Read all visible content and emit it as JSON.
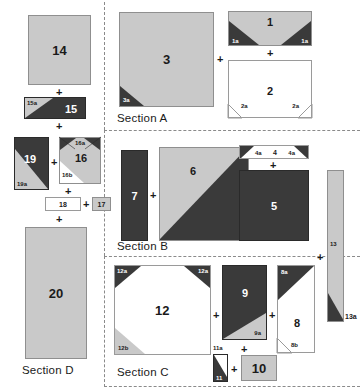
{
  "colors": {
    "gray_fabric": "#c9c9c9",
    "dark_fabric": "#3a3a3a",
    "white_fabric": "#ffffff",
    "outline": "#8f8f8f",
    "divider": "#8a8a8a",
    "text_dark": "#1a1a1a",
    "text_light": "#ffffff"
  },
  "symbols": {
    "plus": "+"
  },
  "sections": [
    {
      "id": "A",
      "label": "Section A"
    },
    {
      "id": "B",
      "label": "Section B"
    },
    {
      "id": "C",
      "label": "Section C"
    },
    {
      "id": "D",
      "label": "Section D"
    }
  ],
  "pieces": {
    "p1": {
      "label": "1",
      "fabric": "gray"
    },
    "p1a_l": {
      "label": "1a",
      "fabric": "dark"
    },
    "p1a_r": {
      "label": "1a",
      "fabric": "dark"
    },
    "p2": {
      "label": "2",
      "fabric": "white"
    },
    "p2a_l": {
      "label": "2a",
      "fabric": "white"
    },
    "p2a_r": {
      "label": "2a",
      "fabric": "white"
    },
    "p3": {
      "label": "3",
      "fabric": "gray"
    },
    "p3a": {
      "label": "3a",
      "fabric": "dark"
    },
    "p4": {
      "label": "4",
      "fabric": "white"
    },
    "p4a_l": {
      "label": "4a",
      "fabric": "dark"
    },
    "p4a_r": {
      "label": "4a",
      "fabric": "dark"
    },
    "p5": {
      "label": "5",
      "fabric": "dark"
    },
    "p6": {
      "label": "6",
      "fabric": "gray-dark-hst"
    },
    "p7": {
      "label": "7",
      "fabric": "dark"
    },
    "p8": {
      "label": "8",
      "fabric": "white"
    },
    "p8a": {
      "label": "8a",
      "fabric": "dark"
    },
    "p8b": {
      "label": "8b",
      "fabric": "white"
    },
    "p9": {
      "label": "9",
      "fabric": "dark"
    },
    "p9a": {
      "label": "9a",
      "fabric": "gray"
    },
    "p10": {
      "label": "10",
      "fabric": "gray"
    },
    "p11": {
      "label": "11",
      "fabric": "dark"
    },
    "p11a": {
      "label": "11a",
      "fabric": "white"
    },
    "p12": {
      "label": "12",
      "fabric": "white"
    },
    "p12a_l": {
      "label": "12a",
      "fabric": "dark"
    },
    "p12a_r": {
      "label": "12a",
      "fabric": "dark"
    },
    "p12b": {
      "label": "12b",
      "fabric": "gray"
    },
    "p13": {
      "label": "13",
      "fabric": "gray"
    },
    "p13a": {
      "label": "13a",
      "fabric": "dark"
    },
    "p14": {
      "label": "14",
      "fabric": "gray"
    },
    "p15": {
      "label": "15",
      "fabric": "dark"
    },
    "p15a": {
      "label": "15a",
      "fabric": "gray"
    },
    "p16": {
      "label": "16",
      "fabric": "gray"
    },
    "p16a": {
      "label": "16a",
      "fabric": "dark"
    },
    "p16b": {
      "label": "16b",
      "fabric": "white"
    },
    "p17": {
      "label": "17",
      "fabric": "gray"
    },
    "p18": {
      "label": "18",
      "fabric": "white"
    },
    "p19": {
      "label": "19",
      "fabric": "dark"
    },
    "p19a": {
      "label": "19a",
      "fabric": "gray"
    },
    "p20": {
      "label": "20",
      "fabric": "gray"
    }
  }
}
